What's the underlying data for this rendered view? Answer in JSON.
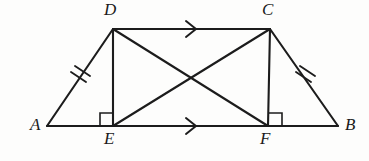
{
  "figure": {
    "kind": "geometry-diagram",
    "caption": "Isosceles trapezoid DCFE inscribed in triangle-like figure ABCD with diagonals",
    "background_color": "#fdfdfc",
    "stroke_color": "#1c1c1c",
    "points": [
      {
        "id": "A",
        "label": "A",
        "x": 47,
        "y": 126,
        "label_x": 30,
        "label_y": 119
      },
      {
        "id": "D",
        "label": "D",
        "x": 113,
        "y": 29,
        "label_x": 106,
        "label_y": 3
      },
      {
        "id": "C",
        "label": "C",
        "x": 270,
        "y": 29,
        "label_x": 263,
        "label_y": 3
      },
      {
        "id": "B",
        "label": "B",
        "x": 338,
        "y": 126,
        "label_x": 345,
        "label_y": 119
      },
      {
        "id": "E",
        "label": "E",
        "x": 113,
        "y": 126,
        "label_x": 105,
        "label_y": 131
      },
      {
        "id": "F",
        "label": "F",
        "x": 268,
        "y": 126,
        "label_x": 261,
        "label_y": 131
      }
    ],
    "segments": [
      {
        "id": "AB",
        "from": "A",
        "to": "B",
        "role": "base"
      },
      {
        "id": "AD",
        "from": "A",
        "to": "D",
        "role": "leg"
      },
      {
        "id": "BC",
        "from": "B",
        "to": "C",
        "role": "leg"
      },
      {
        "id": "DC",
        "from": "D",
        "to": "C",
        "role": "top"
      },
      {
        "id": "DE",
        "from": "D",
        "to": "E",
        "role": "altitude"
      },
      {
        "id": "CF",
        "from": "C",
        "to": "F",
        "role": "altitude"
      },
      {
        "id": "DF",
        "from": "D",
        "to": "F",
        "role": "diagonal"
      },
      {
        "id": "EC",
        "from": "E",
        "to": "C",
        "role": "diagonal"
      }
    ],
    "congruence_marks": [
      {
        "id": "tick-AD",
        "on_segment": "AD",
        "count": 2,
        "x": 80,
        "y": 78
      },
      {
        "id": "tick-BC",
        "on_segment": "BC",
        "count": 2,
        "x": 303,
        "y": 78
      }
    ],
    "parallel_marks": [
      {
        "id": "arrow-DC",
        "on_segment": "DC",
        "count": 1,
        "x": 192,
        "y": 29,
        "direction": "right"
      },
      {
        "id": "arrow-EF",
        "on_segment": "EF",
        "count": 1,
        "x": 192,
        "y": 126,
        "direction": "right"
      }
    ],
    "right_angles": [
      {
        "id": "right-angle-E",
        "at_point": "E",
        "side": "left",
        "size": 13
      },
      {
        "id": "right-angle-F",
        "at_point": "F",
        "side": "right",
        "size": 13
      }
    ]
  }
}
